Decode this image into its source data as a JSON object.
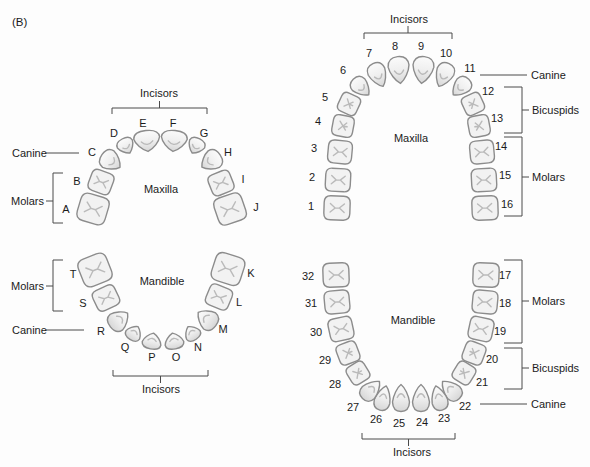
{
  "figure_label": "(B)",
  "colors": {
    "background": "#fdfdfd",
    "tooth_fill": "#f2f2f2",
    "tooth_outline": "#8c8c8c",
    "fissure": "#bababa",
    "annotation_line": "#4a4a4a",
    "text": "#1b1b1b"
  },
  "charts": [
    {
      "id": "primary-maxilla",
      "arch_label": "Maxilla",
      "teeth": [
        "A",
        "B",
        "C",
        "D",
        "E",
        "F",
        "G",
        "H",
        "I",
        "J"
      ],
      "groups": {
        "incisors": "Incisors",
        "canine": "Canine",
        "molars": "Molars"
      }
    },
    {
      "id": "primary-mandible",
      "arch_label": "Mandible",
      "teeth": [
        "K",
        "L",
        "M",
        "N",
        "O",
        "P",
        "Q",
        "R",
        "S",
        "T"
      ],
      "groups": {
        "incisors": "Incisors",
        "canine": "Canine",
        "molars": "Molars"
      }
    },
    {
      "id": "permanent-maxilla",
      "arch_label": "Maxilla",
      "teeth": [
        "1",
        "2",
        "3",
        "4",
        "5",
        "6",
        "7",
        "8",
        "9",
        "10",
        "11",
        "12",
        "13",
        "14",
        "15",
        "16"
      ],
      "groups": {
        "incisors": "Incisors",
        "canine": "Canine",
        "bicuspids": "Bicuspids",
        "molars": "Molars"
      }
    },
    {
      "id": "permanent-mandible",
      "arch_label": "Mandible",
      "teeth": [
        "17",
        "18",
        "19",
        "20",
        "21",
        "22",
        "23",
        "24",
        "25",
        "26",
        "27",
        "28",
        "29",
        "30",
        "31",
        "32"
      ],
      "groups": {
        "incisors": "Incisors",
        "canine": "Canine",
        "bicuspids": "Bicuspids",
        "molars": "Molars"
      }
    }
  ]
}
